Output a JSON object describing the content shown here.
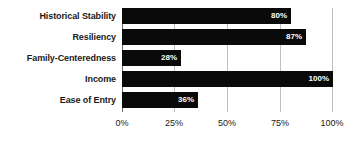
{
  "chart_data": {
    "type": "bar",
    "orientation": "horizontal",
    "title": "",
    "xlabel": "",
    "ylabel": "",
    "categories": [
      "Historical Stability",
      "Resiliency",
      "Family-Centeredness",
      "Income",
      "Ease of Entry"
    ],
    "values": [
      80,
      87,
      28,
      100,
      36
    ],
    "value_labels": [
      "80%",
      "87%",
      "28%",
      "100%",
      "36%"
    ],
    "xlim": [
      0,
      100
    ],
    "xticks": [
      0,
      25,
      50,
      75,
      100
    ],
    "xtick_labels": [
      "0%",
      "25%",
      "50%",
      "75%",
      "100%"
    ],
    "grid": true,
    "legend": false,
    "bar_color": "#0a0a0a",
    "value_label_color": "#ffffff",
    "gridline_color": "#bfbfbf",
    "axis_color": "#6b6b6b",
    "background_color": "#ffffff"
  }
}
